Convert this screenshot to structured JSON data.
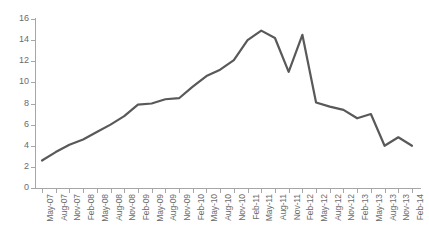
{
  "chart_data": {
    "type": "line",
    "title": "",
    "subtitle": "",
    "xlabel": "",
    "ylabel": "",
    "ylim": [
      0,
      16
    ],
    "yticks": [
      0,
      2,
      4,
      6,
      8,
      10,
      12,
      14,
      16
    ],
    "grid": false,
    "legend": false,
    "legend_position": "none",
    "line_color": "#595959",
    "line_width": 2.2,
    "markers": false,
    "categories": [
      "May-07",
      "Aug-07",
      "Nov-07",
      "Feb-08",
      "May-08",
      "Aug-08",
      "Nov-08",
      "Feb-09",
      "May-09",
      "Aug-09",
      "Nov-09",
      "Feb-10",
      "May-10",
      "Aug-10",
      "Nov-10",
      "Feb-11",
      "May-11",
      "Aug-11",
      "Nov-11",
      "Feb-12",
      "May-12",
      "Aug-12",
      "Nov-12",
      "Feb-13",
      "May-13",
      "Aug-13",
      "Nov-13",
      "Feb-14"
    ],
    "values": [
      2.6,
      3.4,
      4.1,
      4.6,
      5.3,
      6.0,
      6.8,
      7.9,
      8.0,
      8.4,
      8.5,
      9.6,
      10.6,
      11.2,
      12.1,
      14.0,
      14.9,
      14.2,
      11.0,
      14.5,
      8.1,
      7.7,
      7.4,
      6.6,
      7.0,
      4.0,
      4.8,
      4.0
    ]
  },
  "axis": {
    "y_tick_labels": [
      "0",
      "2",
      "4",
      "6",
      "8",
      "10",
      "12",
      "14",
      "16"
    ]
  }
}
